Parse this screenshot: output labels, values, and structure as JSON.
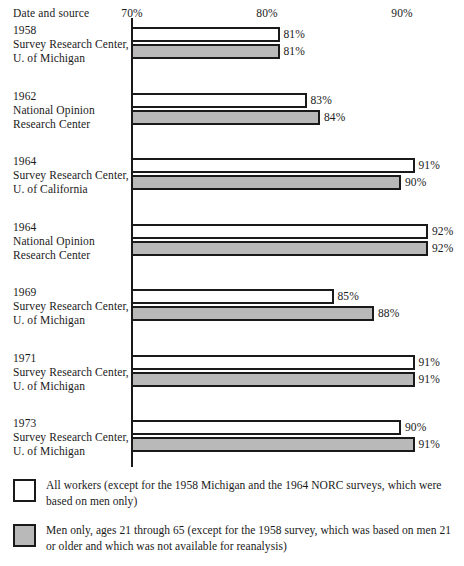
{
  "header": {
    "row_header": "Date and source"
  },
  "axis": {
    "ticks": [
      {
        "label": "70%",
        "value": 70
      },
      {
        "label": "80%",
        "value": 80
      },
      {
        "label": "90%",
        "value": 90
      }
    ]
  },
  "legend": [
    {
      "swatch": "white",
      "text": "All workers (except for the 1958 Michigan and the 1964 NORC surveys, which were based on men only)"
    },
    {
      "swatch": "gray",
      "text": "Men only, ages 21 through 65 (except for the 1958 survey, which was based on men 21 or older and which was not available for reanalysis)"
    }
  ],
  "colors": {
    "ink": "#1a1a1a",
    "all_workers_fill": "#ffffff",
    "men_only_fill": "#b9b9b9",
    "background": "#ffffff"
  },
  "chart_data": {
    "type": "bar",
    "orientation": "horizontal",
    "title": "",
    "subtitle": "",
    "xlabel": "",
    "ylabel": "Date and source",
    "xlim": [
      70,
      92.5
    ],
    "grid": false,
    "legend_position": "bottom",
    "tick_labels": [
      "70%",
      "80%",
      "90%"
    ],
    "tick_values": [
      70,
      80,
      90
    ],
    "categories": [
      "1958 Survey Research Center, U. of Michigan",
      "1962 National Opinion Research Center",
      "1964 Survey Research Center, U. of California",
      "1964 National Opinion Research Center",
      "1969 Survey Research Center, U. of Michigan",
      "1971 Survey Research Center, U. of Michigan",
      "1973 Survey Research Center, U. of Michigan"
    ],
    "series": [
      {
        "name": "All workers",
        "values": [
          81,
          83,
          91,
          92,
          85,
          91,
          90
        ]
      },
      {
        "name": "Men only, ages 21 through 65",
        "values": [
          81,
          84,
          90,
          92,
          88,
          91,
          91
        ]
      }
    ]
  },
  "groups": [
    {
      "year": "1958",
      "source_line1": "Survey Research Center,",
      "source_line2": "U. of Michigan",
      "all_workers": {
        "value": 81,
        "label": "81%"
      },
      "men_only": {
        "value": 81,
        "label": "81%"
      }
    },
    {
      "year": "1962",
      "source_line1": "National Opinion",
      "source_line2": "Research Center",
      "all_workers": {
        "value": 83,
        "label": "83%"
      },
      "men_only": {
        "value": 84,
        "label": "84%"
      }
    },
    {
      "year": "1964",
      "source_line1": "Survey Research Center,",
      "source_line2": "U. of California",
      "all_workers": {
        "value": 91,
        "label": "91%"
      },
      "men_only": {
        "value": 90,
        "label": "90%"
      }
    },
    {
      "year": "1964",
      "source_line1": "National Opinion",
      "source_line2": "Research Center",
      "all_workers": {
        "value": 92,
        "label": "92%"
      },
      "men_only": {
        "value": 92,
        "label": "92%"
      }
    },
    {
      "year": "1969",
      "source_line1": "Survey Research Center,",
      "source_line2": "U. of Michigan",
      "all_workers": {
        "value": 85,
        "label": "85%"
      },
      "men_only": {
        "value": 88,
        "label": "88%"
      }
    },
    {
      "year": "1971",
      "source_line1": "Survey Research Center,",
      "source_line2": "U. of Michigan",
      "all_workers": {
        "value": 91,
        "label": "91%"
      },
      "men_only": {
        "value": 91,
        "label": "91%"
      }
    },
    {
      "year": "1973",
      "source_line1": "Survey Research Center,",
      "source_line2": "U. of Michigan",
      "all_workers": {
        "value": 90,
        "label": "90%"
      },
      "men_only": {
        "value": 91,
        "label": "91%"
      }
    }
  ]
}
